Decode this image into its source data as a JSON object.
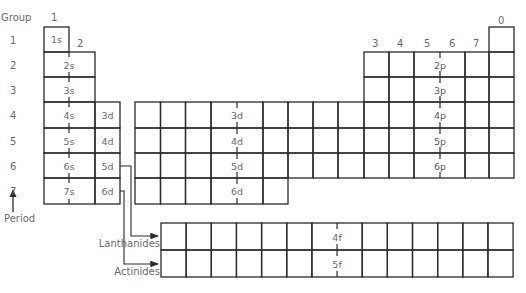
{
  "diagram": {
    "type": "periodic-table-blocks",
    "axis_labels": {
      "group": "Group",
      "period": "Period"
    },
    "groups": {
      "s_block": [
        "1",
        "2"
      ],
      "p_block": [
        "3",
        "4",
        "5",
        "6",
        "7"
      ],
      "noble": "0"
    },
    "periods": [
      "1",
      "2",
      "3",
      "4",
      "5",
      "6",
      "7"
    ],
    "s_block": {
      "labels": [
        "1s",
        "2s",
        "3s",
        "4s",
        "5s",
        "6s",
        "7s"
      ]
    },
    "d_block": {
      "side_labels": [
        "3d",
        "4d",
        "5d",
        "6d"
      ],
      "center_labels": [
        "3d",
        "4d",
        "5d",
        "6d"
      ]
    },
    "p_block": {
      "labels": [
        "2p",
        "3p",
        "4p",
        "5p",
        "6p"
      ],
      "color": "#878787"
    },
    "f_block": {
      "rows": [
        {
          "name": "Lanthanides",
          "label": "4f",
          "color": "#cfcfcf"
        },
        {
          "name": "Actinides",
          "label": "5f",
          "color": "#e3e3e3"
        }
      ]
    }
  }
}
